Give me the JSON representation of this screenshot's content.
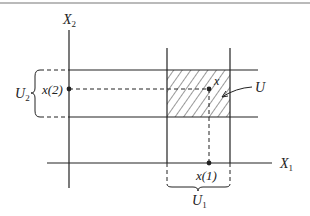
{
  "diagram": {
    "axes": {
      "x_label": "X",
      "x_label_sub": "1",
      "y_label": "X",
      "y_label_sub": "2"
    },
    "labels": {
      "point_x": "x",
      "x1": "x(1)",
      "x2": "x(2)",
      "U": "U",
      "U1": "U",
      "U1_sub": "1",
      "U2": "U",
      "U2_sub": "2"
    },
    "colors": {
      "line": "#222222",
      "hatch": "#333333",
      "rule": "#777777"
    }
  }
}
